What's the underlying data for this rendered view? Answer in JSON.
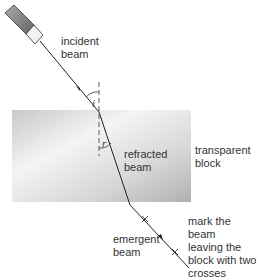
{
  "labels": {
    "incident": [
      "incident",
      "beam"
    ],
    "refracted": [
      "refracted",
      "beam"
    ],
    "block": [
      "transparent",
      "block"
    ],
    "emergent": [
      "emergent",
      "beam"
    ],
    "mark": [
      "mark the beam",
      "leaving the",
      "block with two",
      "crosses"
    ],
    "angle_i": "i",
    "angle_r": "r"
  },
  "colors": {
    "beam": "#222222",
    "block_light": "#f2f2f2",
    "block_dark": "#b8b8b8"
  }
}
